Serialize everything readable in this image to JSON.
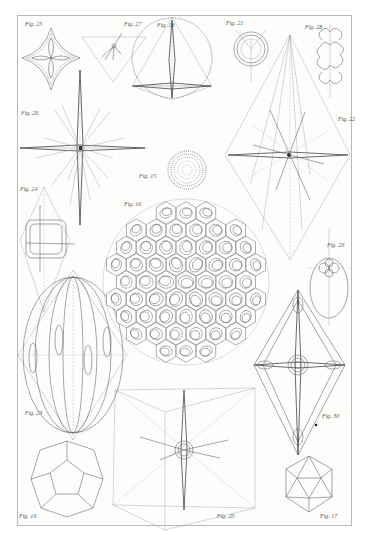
{
  "plate": {
    "background": "#fdfdfc",
    "border_color": "#b9b9b9",
    "ink_color": "#6a6a6a"
  },
  "figures": [
    {
      "id": "fig25",
      "label": "Fig. 25",
      "subject": "four-lobed star cell"
    },
    {
      "id": "fig27",
      "label": "Fig. 27",
      "subject": "triangle axis construction"
    },
    {
      "id": "fig18",
      "label": "Fig. 18",
      "subject": "spherical radiolarian with cross spines"
    },
    {
      "id": "fig21",
      "label": "Fig. 21",
      "subject": "three-lobed ring"
    },
    {
      "id": "fig28",
      "label": "Fig. 28",
      "subject": "six-lobed cell"
    },
    {
      "id": "fig26",
      "label": "Fig. 26",
      "subject": "radiating spine star"
    },
    {
      "id": "fig22",
      "label": "Fig. 22",
      "subject": "rhombic axis construction"
    },
    {
      "id": "fig15",
      "label": "Fig. 15",
      "subject": "spiny latticed sphere"
    },
    {
      "id": "fig24",
      "label": "Fig. 24",
      "subject": "prismatic shell in bipyramid"
    },
    {
      "id": "fig16",
      "label": "Fig. 16",
      "subject": "latticed hexagonal-pored sphere"
    },
    {
      "id": "fig29",
      "label": "Fig. 29",
      "subject": "oval cell with central body"
    },
    {
      "id": "fig23",
      "label": "Fig. 23",
      "subject": "meridional ribbed sphere in bipyramid"
    },
    {
      "id": "fig30",
      "label": "Fig. 30",
      "subject": "rhombic frame with central disc"
    },
    {
      "id": "fig20",
      "label": "Fig. 20",
      "subject": "cross spines in cube construction"
    },
    {
      "id": "fig19",
      "label": "Fig. 19",
      "subject": "dodecahedron"
    },
    {
      "id": "fig17",
      "label": "Fig. 17",
      "subject": "icosahedron"
    }
  ],
  "axis_letters": [
    "a",
    "b",
    "c",
    "d",
    "e",
    "f",
    "g",
    "h",
    "i",
    "k",
    "l",
    "m",
    "n",
    "o",
    "p",
    "r",
    "s",
    "t"
  ]
}
